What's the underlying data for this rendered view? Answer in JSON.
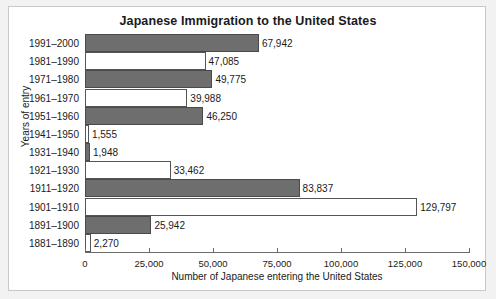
{
  "chart_data": {
    "type": "bar",
    "orientation": "horizontal",
    "title": "Japanese Immigration to the United States",
    "xlabel": "Number of Japanese entering the United States",
    "ylabel": "Years of entry",
    "xlim": [
      0,
      150000
    ],
    "xticks": [
      0,
      25000,
      50000,
      75000,
      100000,
      125000,
      150000
    ],
    "xticklabels": [
      "0",
      "25,000",
      "50,000",
      "75,000",
      "100,000",
      "125,000",
      "150,000"
    ],
    "grid": false,
    "legend": null,
    "categories": [
      "1991–2000",
      "1981–1990",
      "1971–1980",
      "1961–1970",
      "1951–1960",
      "1941–1950",
      "1931–1940",
      "1921–1930",
      "1911–1920",
      "1901–1910",
      "1891–1900",
      "1881–1890"
    ],
    "values": [
      67942,
      47085,
      49775,
      39988,
      46250,
      1555,
      1948,
      33462,
      83837,
      129797,
      25942,
      2270
    ],
    "value_labels": [
      "67,942",
      "47,085",
      "49,775",
      "39,988",
      "46,250",
      "1,555",
      "1,948",
      "33,462",
      "83,837",
      "129,797",
      "25,942",
      "2,270"
    ],
    "bar_fills": [
      "dark",
      "light",
      "dark",
      "light",
      "dark",
      "light",
      "dark",
      "light",
      "dark",
      "light",
      "dark",
      "light"
    ],
    "colors": {
      "dark_bar": "#6e6e6e",
      "light_bar": "#ffffff",
      "bar_border": "#555555",
      "axis": "#6b6b6b",
      "text": "#1a1a1a",
      "figure_background": "#ffffff",
      "page_background": "#f2f2f2",
      "figure_border": "#c9c9c9"
    }
  }
}
